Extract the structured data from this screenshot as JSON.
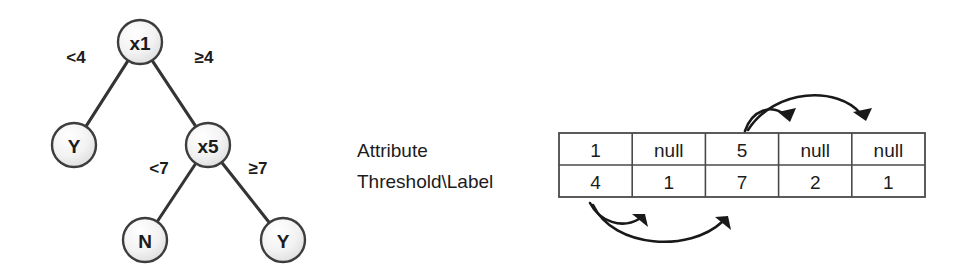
{
  "figure": {
    "tree": {
      "name": "decision-tree",
      "nodes": [
        {
          "id": "root",
          "label": "x1",
          "cx": 140,
          "cy": 42,
          "r": 22,
          "kind": "internal"
        },
        {
          "id": "leafY1",
          "label": "Y",
          "cx": 74,
          "cy": 145,
          "r": 22,
          "kind": "leaf"
        },
        {
          "id": "x5",
          "label": "x5",
          "cx": 208,
          "cy": 145,
          "r": 22,
          "kind": "internal"
        },
        {
          "id": "leafN",
          "label": "N",
          "cx": 145,
          "cy": 240,
          "r": 22,
          "kind": "leaf"
        },
        {
          "id": "leafY2",
          "label": "Y",
          "cx": 283,
          "cy": 240,
          "r": 22,
          "kind": "leaf"
        }
      ],
      "edges": [
        {
          "from": "root",
          "to": "leafY1",
          "label": "<4",
          "lx": 76,
          "ly": 57
        },
        {
          "from": "root",
          "to": "x5",
          "label": "≥4",
          "lx": 204,
          "ly": 57
        },
        {
          "from": "x5",
          "to": "leafN",
          "label": "<7",
          "lx": 159,
          "ly": 168
        },
        {
          "from": "x5",
          "to": "leafY2",
          "label": "≥7",
          "lx": 258,
          "ly": 168
        }
      ]
    },
    "table": {
      "name": "array-representation",
      "row_labels": [
        "Attribute",
        "Threshold\\Label"
      ],
      "rows": [
        [
          "1",
          "null",
          "5",
          "null",
          "null"
        ],
        [
          "4",
          "1",
          "7",
          "2",
          "1"
        ]
      ],
      "geometry": {
        "x": 559,
        "y": 133,
        "width": 366,
        "height": 64,
        "columns": 5,
        "rows": 2
      },
      "label_x": 357,
      "label_y_row1": 150,
      "label_y_row2": 181
    },
    "pointers": {
      "above": [
        {
          "name": "pointer-child-left-of-x5",
          "from_col": 3,
          "to_col": 4,
          "path": "M 745 131 C 752 110 772 103 786 116",
          "head": "790 122 778 112 796 108"
        },
        {
          "name": "pointer-child-right-of-x5",
          "from_col": 3,
          "to_col": 5,
          "path": "M 748 130 C 775 88 838 86 861 114",
          "head": "866 121 853 112 872 108"
        }
      ],
      "below": [
        {
          "name": "pointer-child-left-of-x1",
          "from_col": 1,
          "to_col": 2,
          "path": "M 590 203 C 600 222 622 229 639 219",
          "head": "645 214 632 214 648 227"
        },
        {
          "name": "pointer-child-right-of-x1",
          "from_col": 1,
          "to_col": 3,
          "path": "M 593 205 C 614 249 690 252 722 222",
          "head": "728 216 715 217 731 230"
        }
      ]
    },
    "colors": {
      "node_fill_light": "#fcfcfc",
      "node_fill_dark": "#e2e2e2",
      "stroke": "#3d3d3d",
      "text": "#1c1c1c",
      "grid": "#4a4a4a",
      "pointer": "#191919",
      "background": "#ffffff"
    }
  }
}
